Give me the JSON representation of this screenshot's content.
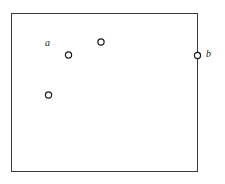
{
  "figure": {
    "background_color": "#ffffff",
    "width": 225,
    "height": 184
  },
  "boundary": {
    "name": "rectangle-region",
    "shape": "rectangle",
    "x": 11.5,
    "y": 13.5,
    "width": 186,
    "height": 158,
    "stroke_color": "#3a3a3a",
    "stroke_width": 1,
    "fill_color": "#ffffff"
  },
  "labels": [
    {
      "id": "a",
      "text": "a",
      "x": 49,
      "y": 44,
      "style": "italic-serif",
      "color": "#1a1a1a"
    },
    {
      "id": "b",
      "text": "b",
      "x": 209,
      "y": 55,
      "style": "italic-serif",
      "color": "#1a1a1a"
    }
  ],
  "points": [
    {
      "id": "point-top",
      "cx": 101,
      "cy": 42,
      "r": 3.1,
      "stroke_color": "#1a1a1a",
      "stroke_width": 1.2,
      "fill_color": "#ffffff",
      "location": "interior"
    },
    {
      "id": "point-middle",
      "cx": 68.5,
      "cy": 55,
      "r": 3.1,
      "stroke_color": "#1a1a1a",
      "stroke_width": 1.2,
      "fill_color": "#ffffff",
      "location": "interior"
    },
    {
      "id": "point-lower-left",
      "cx": 48.5,
      "cy": 95,
      "r": 3.1,
      "stroke_color": "#1a1a1a",
      "stroke_width": 1.2,
      "fill_color": "#ffffff",
      "location": "interior"
    },
    {
      "id": "point-boundary",
      "cx": 197.5,
      "cy": 55.5,
      "r": 3.1,
      "stroke_color": "#1a1a1a",
      "stroke_width": 1.2,
      "fill_color": "#ffffff",
      "location": "on-right-edge"
    }
  ]
}
